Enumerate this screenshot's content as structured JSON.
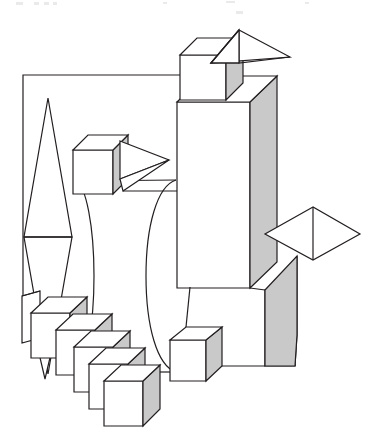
{
  "meta": {
    "canvas_width": 387,
    "canvas_height": 434,
    "background_color": "#ffffff",
    "stroke_color": "#231f20",
    "face_light_color": "#ffffff",
    "face_shade_color": "#c9c9c9",
    "stroke_width": 1.2
  },
  "scene": {
    "description": "Black-and-white technical line drawing of assorted 3D primitives: boxes, a cylinder, cones and bipyramids, connected by thin outline polylines.",
    "shape_count": 14,
    "shapes": [
      {
        "id": "outline-frame",
        "name": "background-outline-frame",
        "type": "polyline",
        "label": "Open rectangular frame line",
        "stroke": "#231f20"
      },
      {
        "id": "bipyramid-left",
        "name": "left-tall-bipyramid",
        "type": "bipyramid",
        "label": "Tall left double cone",
        "apex_top": [
          48,
          98
        ],
        "apex_bottom": [
          48,
          374
        ],
        "waist_y": 237
      },
      {
        "id": "cube-top",
        "name": "top-cube",
        "type": "box",
        "label": "Top small cube",
        "x": 180,
        "y": 37,
        "w": 46,
        "h": 62
      },
      {
        "id": "cone-top-right",
        "name": "top-right-cone",
        "type": "cone",
        "label": "Upper right wireframe cone pointing right",
        "apex": [
          289,
          56
        ]
      },
      {
        "id": "cube-mid-left",
        "name": "mid-left-cube",
        "type": "box",
        "label": "Middle left cube",
        "x": 73,
        "y": 135,
        "w": 40,
        "h": 59
      },
      {
        "id": "cone-mid",
        "name": "mid-cone",
        "type": "cone",
        "label": "Middle wireframe cone pointing right",
        "apex": [
          169,
          160
        ]
      },
      {
        "id": "cylinder-center",
        "name": "center-cylinder",
        "type": "cylinder",
        "label": "Large central cylinder",
        "left_x": 76,
        "right_x": 176,
        "top_y": 180,
        "bottom_y": 372
      },
      {
        "id": "tower-box",
        "name": "tall-tower-box",
        "type": "box",
        "label": "Tall central tower box",
        "x": 177,
        "y": 96,
        "w": 73,
        "h": 190
      },
      {
        "id": "bipyramid-right",
        "name": "right-diamond-bipyramid",
        "type": "bipyramid",
        "label": "Right diamond bipyramid",
        "center": [
          313,
          233
        ]
      },
      {
        "id": "box-lower-right",
        "name": "lower-right-box",
        "type": "box",
        "label": "Lower right shaded box",
        "x": 265,
        "y": 268,
        "w": 35,
        "h": 98
      },
      {
        "id": "cube-bottom-center",
        "name": "bottom-center-cube",
        "type": "box",
        "label": "Bottom center cube",
        "x": 170,
        "y": 327,
        "w": 36,
        "h": 52
      },
      {
        "id": "box-left-slim",
        "name": "left-slim-box",
        "type": "box",
        "label": "Narrow left box",
        "x": 22,
        "y": 291,
        "w": 18,
        "h": 52
      },
      {
        "id": "cube-stair",
        "name": "cube-staircase",
        "type": "box-series",
        "label": "Descending staircase of five cubes",
        "count": 5,
        "step_dx": 25,
        "step_dy": 17
      }
    ]
  },
  "top_artifacts": {
    "label": "faint cut-off text remnants along top edge",
    "marks": [
      {
        "x": 16,
        "y": 2,
        "w": 7,
        "h": 3
      },
      {
        "x": 34,
        "y": 2,
        "w": 5,
        "h": 3
      },
      {
        "x": 44,
        "y": 2,
        "w": 5,
        "h": 3
      },
      {
        "x": 53,
        "y": 2,
        "w": 4,
        "h": 3
      },
      {
        "x": 163,
        "y": 2,
        "w": 4,
        "h": 2
      },
      {
        "x": 226,
        "y": 1,
        "w": 9,
        "h": 2
      },
      {
        "x": 305,
        "y": 2,
        "w": 4,
        "h": 2
      },
      {
        "x": 236,
        "y": 11,
        "w": 7,
        "h": 3
      }
    ]
  }
}
